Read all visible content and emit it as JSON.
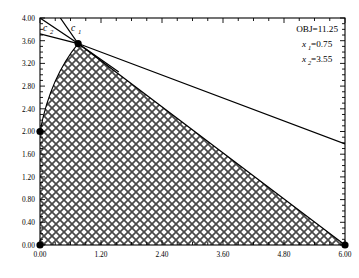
{
  "chart_data": {
    "type": "line",
    "title": "",
    "xlabel": "",
    "ylabel": "",
    "xlim": [
      0.0,
      6.0
    ],
    "ylim": [
      0.0,
      4.0
    ],
    "grid": false,
    "legend_position": "none",
    "xticks": [
      "0.00",
      "1.20",
      "2.40",
      "3.60",
      "4.80",
      "6.00"
    ],
    "xtick_values": [
      0.0,
      1.2,
      2.4,
      3.6,
      4.8,
      6.0
    ],
    "yticks": [
      "0.00",
      "0.40",
      "0.80",
      "1.20",
      "1.60",
      "2.00",
      "2.40",
      "2.80",
      "3.20",
      "3.60",
      "4.00"
    ],
    "ytick_values": [
      0.0,
      0.4,
      0.8,
      1.2,
      1.6,
      2.0,
      2.4,
      2.8,
      3.2,
      3.6,
      4.0
    ],
    "minor_ticks_per_interval": 3,
    "series": [
      {
        "name": "c1",
        "label": "c",
        "label_sub": "1",
        "type": "constraint-line",
        "points": [
          [
            0.4,
            4.0
          ],
          [
            0.75,
            3.55
          ],
          [
            6.0,
            0.0
          ]
        ],
        "color": "#000000"
      },
      {
        "name": "c2",
        "label": "c",
        "label_sub": "2",
        "type": "constraint-line",
        "points": [
          [
            0.0,
            4.0
          ],
          [
            0.75,
            3.55
          ],
          [
            1.55,
            3.05
          ]
        ],
        "color": "#000000"
      },
      {
        "name": "objective",
        "label": "objective",
        "type": "objective-line",
        "points": [
          [
            0.0,
            3.72
          ],
          [
            0.75,
            3.55
          ],
          [
            6.0,
            1.78
          ]
        ],
        "color": "#000000"
      }
    ],
    "feasible_region": {
      "name": "feasible-region",
      "fill": "crosshatch",
      "vertices": [
        [
          0.0,
          0.0
        ],
        [
          0.0,
          2.0
        ],
        [
          0.75,
          3.55
        ],
        [
          6.0,
          0.0
        ]
      ],
      "boundary_curve": {
        "from": [
          0.0,
          2.0
        ],
        "to": [
          0.75,
          3.55
        ],
        "control": [
          0.2,
          2.95
        ]
      }
    },
    "vertex_points": [
      {
        "x": 0.0,
        "y": 0.0
      },
      {
        "x": 0.0,
        "y": 2.0
      },
      {
        "x": 0.75,
        "y": 3.55
      },
      {
        "x": 6.0,
        "y": 0.0
      }
    ],
    "annotations": [
      {
        "name": "obj-value",
        "text": "OBJ=11.25",
        "x": 5.55,
        "y": 3.78
      },
      {
        "name": "x1-value",
        "base": "x",
        "sub": "1",
        "text": "=0.75",
        "x": 5.55,
        "y": 3.5
      },
      {
        "name": "x2-value",
        "base": "x",
        "sub": "2",
        "text": "=3.55",
        "x": 5.55,
        "y": 3.22
      }
    ]
  },
  "colors": {
    "axis": "#000000",
    "line": "#000000",
    "point": "#000000",
    "background": "#ffffff",
    "hatch": "#555555"
  }
}
